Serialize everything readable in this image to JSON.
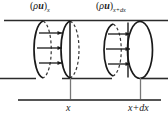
{
  "figure": {
    "kind": "control-volume-mass-flux-diagram",
    "caption_text": "",
    "labels": {
      "flux_left": {
        "open_paren": "(",
        "rho": "ρ",
        "u": "u",
        "close_paren": ")",
        "subscript": "x",
        "plain": "(ρu)x"
      },
      "flux_right": {
        "open_paren": "(",
        "rho": "ρ",
        "u": "u",
        "close_paren": ")",
        "subscript": "x+dx",
        "plain": "(ρu)x+dx"
      },
      "tick_left": "x",
      "tick_right": "x+dx"
    },
    "colors": {
      "stroke": "#1a1a1a",
      "axis": "#555555",
      "tick_line": "#777777",
      "background": "#ffffff",
      "dashed": "#333333"
    },
    "geometry": {
      "top_rule_y": 20,
      "bottom_rule_y": 78,
      "axis_y": 100,
      "tick_x_left": 70,
      "tick_x_right": 140,
      "cylinder_left_x": 28,
      "cylinder_right_x": 148
    },
    "arrow_counts": {
      "left_group": 3,
      "right_group": 3
    }
  }
}
